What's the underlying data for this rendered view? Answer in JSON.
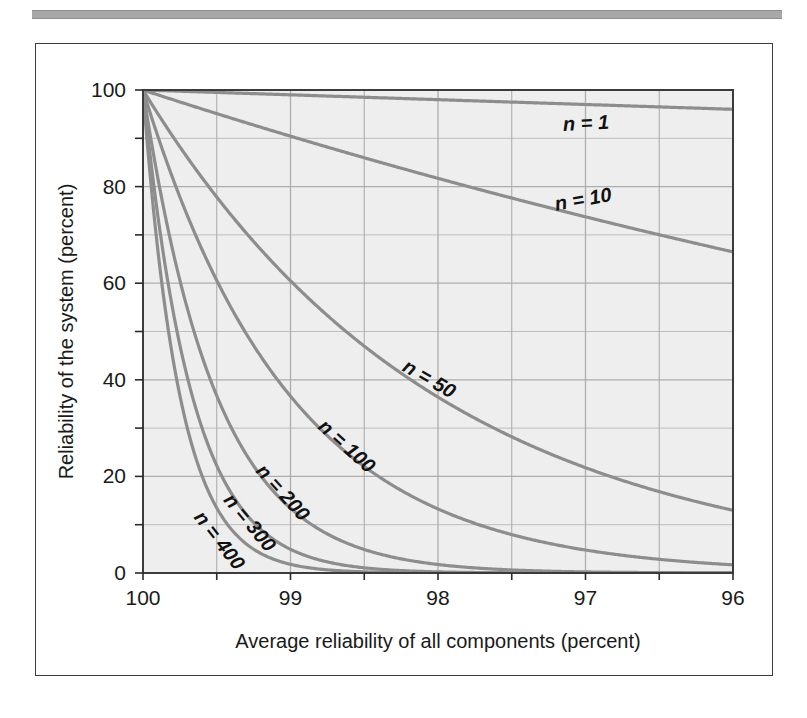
{
  "figure": {
    "background_color": "#ffffff",
    "frame_color": "#3b3b3b",
    "plot_background_color": "#eeeeee",
    "grid_color": "#adadad",
    "curve_color": "#8d8d8d",
    "text_color": "#1a1a1a",
    "top_rule_color": "#a8a8a8"
  },
  "chart_data": {
    "type": "line",
    "title": "",
    "subtitle": "",
    "xlabel": "Average reliability of all components (percent)",
    "ylabel": "Reliability of the system (percent)",
    "xlim": [
      100,
      96
    ],
    "ylim": [
      0,
      100
    ],
    "x_tick_labels": [
      "100",
      "99",
      "98",
      "97",
      "96"
    ],
    "x_ticks": [
      100,
      99,
      98,
      97,
      96
    ],
    "x_minor_ticks": [
      99.5,
      98.5,
      97.5,
      96.5
    ],
    "y_tick_labels": [
      "100",
      "80",
      "60",
      "40",
      "20",
      "0"
    ],
    "y_ticks": [
      100,
      80,
      60,
      40,
      20,
      0
    ],
    "y_minor_ticks": [
      90,
      70,
      50,
      30,
      10
    ],
    "grid": true,
    "grid_minor": true,
    "legend": "inline-curve-labels",
    "x": [
      100,
      99.75,
      99.5,
      99.25,
      99,
      98.75,
      98.5,
      98.25,
      98,
      97.75,
      97.5,
      97.25,
      97,
      96.75,
      96.5,
      96.25,
      96
    ],
    "series": [
      {
        "name": "n = 1",
        "n": 1,
        "label": "n = 1",
        "label_x": 97.15,
        "label_y": 91.5,
        "label_rotation": -3,
        "values": [
          100.0,
          99.75,
          99.5,
          99.25,
          99.0,
          98.75,
          98.5,
          98.25,
          98.0,
          97.75,
          97.5,
          97.25,
          97.0,
          96.75,
          96.5,
          96.25,
          96.0
        ]
      },
      {
        "name": "n = 10",
        "n": 10,
        "label": "n = 10",
        "label_x": 97.2,
        "label_y": 75.0,
        "label_rotation": -10,
        "values": [
          100.0,
          97.53,
          95.11,
          92.76,
          90.44,
          88.19,
          85.97,
          83.81,
          81.71,
          79.64,
          77.63,
          75.66,
          73.74,
          71.86,
          70.03,
          68.24,
          66.48
        ]
      },
      {
        "name": "n = 50",
        "n": 50,
        "label": "n = 50",
        "label_x": 98.25,
        "label_y": 42.0,
        "label_rotation": 30,
        "values": [
          100.0,
          88.25,
          77.83,
          68.62,
          60.5,
          53.31,
          46.96,
          41.34,
          36.42,
          32.05,
          28.21,
          24.82,
          21.83,
          19.2,
          16.89,
          14.84,
          13.04
        ]
      },
      {
        "name": "n = 100",
        "n": 100,
        "label": "n = 100",
        "label_x": 98.82,
        "label_y": 30.0,
        "label_rotation": 42,
        "values": [
          100.0,
          77.88,
          60.58,
          47.09,
          36.6,
          28.42,
          22.05,
          17.09,
          13.26,
          10.27,
          7.96,
          6.16,
          4.76,
          3.69,
          2.85,
          2.2,
          1.7
        ]
      },
      {
        "name": "n = 200",
        "n": 200,
        "label": "n = 200",
        "label_x": 99.24,
        "label_y": 21.0,
        "label_rotation": 48,
        "values": [
          100.0,
          60.66,
          36.7,
          22.17,
          13.4,
          8.08,
          4.86,
          2.92,
          1.76,
          1.06,
          0.63,
          0.38,
          0.23,
          0.14,
          0.08,
          0.05,
          0.03
        ]
      },
      {
        "name": "n = 300",
        "n": 300,
        "label": "n = 300",
        "label_x": 99.46,
        "label_y": 15.0,
        "label_rotation": 50,
        "values": [
          100.0,
          47.25,
          22.23,
          10.44,
          4.9,
          2.3,
          1.07,
          0.5,
          0.23,
          0.11,
          0.05,
          0.02,
          0.01,
          0.0,
          0.0,
          0.0,
          0.0
        ]
      },
      {
        "name": "n = 400",
        "n": 400,
        "label": "n = 400",
        "label_x": 99.66,
        "label_y": 11.5,
        "label_rotation": 52,
        "values": [
          100.0,
          36.8,
          13.47,
          4.92,
          1.79,
          0.65,
          0.24,
          0.09,
          0.03,
          0.01,
          0.0,
          0.0,
          0.0,
          0.0,
          0.0,
          0.0,
          0.0
        ]
      }
    ]
  }
}
